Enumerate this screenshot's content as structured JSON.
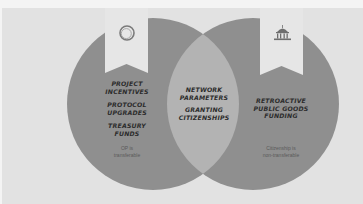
{
  "colors": {
    "background": "#e2e2e2",
    "circle": "#8f8f8f",
    "intersection": "#b3b3b3",
    "banner": "#e6e6e6",
    "text": "#2c2c2c"
  },
  "left": {
    "icon": "optimism-ring-icon",
    "items": [
      [
        "PROJECT",
        "INCENTIVES"
      ],
      [
        "PROTOCOL",
        "UPGRADES"
      ],
      [
        "TREASURY",
        "FUNDS"
      ]
    ],
    "note": [
      "OP is",
      "transferable"
    ]
  },
  "center": {
    "items": [
      [
        "NETWORK",
        "PARAMETERS"
      ],
      [
        "GRANTING",
        "CITIZENSHIPS"
      ]
    ]
  },
  "right": {
    "icon": "capitol-building-icon",
    "items": [
      [
        "RETROACTIVE",
        "PUBLIC GOODS",
        "FUNDING"
      ]
    ],
    "note": [
      "Citizenship is",
      "non-transferable"
    ]
  }
}
